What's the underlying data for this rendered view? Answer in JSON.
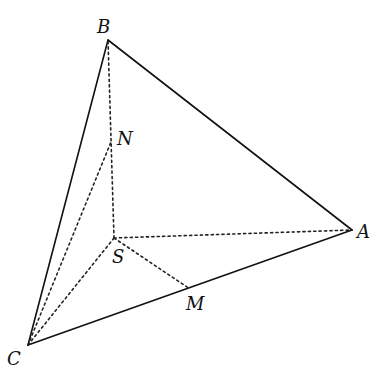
{
  "diagram": {
    "type": "tetrahedron",
    "colors": {
      "line": "#111111",
      "background": "#ffffff"
    },
    "vertices": {
      "B": {
        "label": "B",
        "x": 108,
        "y": 40
      },
      "A": {
        "label": "A",
        "x": 352,
        "y": 230
      },
      "C": {
        "label": "C",
        "x": 28,
        "y": 345
      },
      "S": {
        "label": "S",
        "x": 114,
        "y": 238
      },
      "N": {
        "label": "N",
        "x": 111,
        "y": 142
      },
      "M": {
        "label": "M",
        "x": 190,
        "y": 289
      }
    },
    "labels": {
      "B": "B",
      "A": "A",
      "C": "C",
      "S": "S",
      "N": "N",
      "M": "M"
    },
    "solid_edges": [
      [
        "B",
        "A"
      ],
      [
        "B",
        "C"
      ],
      [
        "C",
        "A"
      ]
    ],
    "dashed_edges": [
      [
        "S",
        "B"
      ],
      [
        "S",
        "A"
      ],
      [
        "S",
        "C"
      ],
      [
        "S",
        "M"
      ],
      [
        "C",
        "N"
      ]
    ]
  }
}
